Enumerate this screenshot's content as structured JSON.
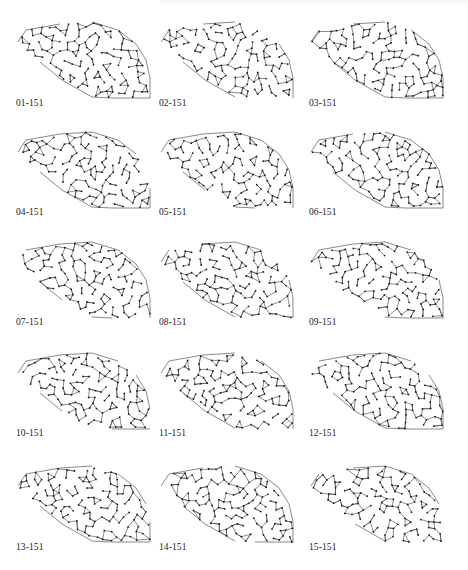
{
  "figure": {
    "style": {
      "edge_color": "#3a3a3a",
      "node_color": "#1a1a1a",
      "background": "#ffffff"
    },
    "outline": [
      [
        18,
        42
      ],
      [
        26,
        30
      ],
      [
        60,
        24
      ],
      [
        92,
        22
      ],
      [
        118,
        30
      ],
      [
        136,
        44
      ],
      [
        146,
        60
      ],
      [
        150,
        78
      ],
      [
        150,
        98
      ],
      [
        112,
        98
      ],
      [
        92,
        97
      ],
      [
        62,
        80
      ],
      [
        40,
        62
      ]
    ],
    "cells": [
      {
        "label": "01-151",
        "seed": 101
      },
      {
        "label": "02-151",
        "seed": 202
      },
      {
        "label": "03-151",
        "seed": 303
      },
      {
        "label": "04-151",
        "seed": 404
      },
      {
        "label": "05-151",
        "seed": 505
      },
      {
        "label": "06-151",
        "seed": 606
      },
      {
        "label": "07-151",
        "seed": 707
      },
      {
        "label": "08-151",
        "seed": 808
      },
      {
        "label": "09-151",
        "seed": 909
      },
      {
        "label": "10-151",
        "seed": 1010
      },
      {
        "label": "11-151",
        "seed": 1111
      },
      {
        "label": "12-151",
        "seed": 1212
      },
      {
        "label": "13-151",
        "seed": 1313
      },
      {
        "label": "14-151",
        "seed": 1414
      },
      {
        "label": "15-151",
        "seed": 1515
      }
    ],
    "nodes_per_graph": 151
  }
}
